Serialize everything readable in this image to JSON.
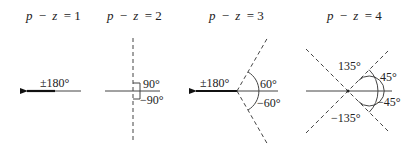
{
  "diagrams": [
    {
      "title_var": "p",
      "title_op": "−",
      "title_var2": "z",
      "title_eq": "= 1",
      "labels": {
        "pm180": "±180°"
      }
    },
    {
      "title_var": "p",
      "title_op": "−",
      "title_var2": "z",
      "title_eq": "= 2",
      "labels": {
        "pos": "90°",
        "neg": "−90°"
      }
    },
    {
      "title_var": "p",
      "title_op": "−",
      "title_var2": "z",
      "title_eq": "= 3",
      "labels": {
        "pm180": "±180°",
        "pos": "60°",
        "neg": "−60°"
      }
    },
    {
      "title_var": "p",
      "title_op": "−",
      "title_var2": "z",
      "title_eq": "= 4",
      "labels": {
        "p135": "135°",
        "p45": "45°",
        "n45": "−45°",
        "n135": "−135°"
      }
    }
  ]
}
